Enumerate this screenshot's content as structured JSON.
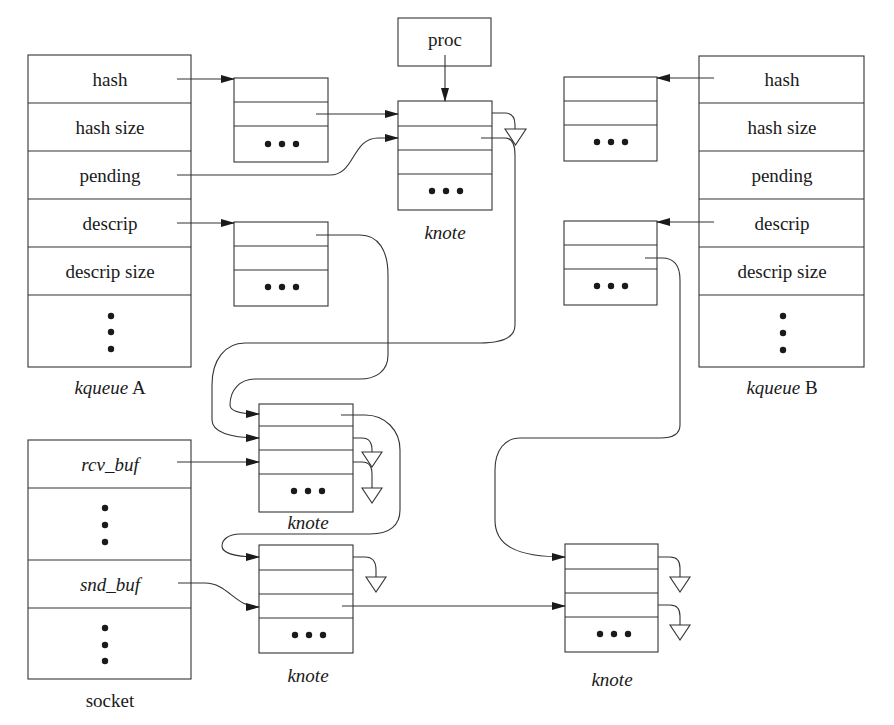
{
  "diagram": {
    "kqueue_a": {
      "caption_italic": "kqueue",
      "caption_suffix": " A",
      "fields": [
        "hash",
        "hash size",
        "pending",
        "descrip",
        "descrip size"
      ],
      "ellipsis": "⋮"
    },
    "kqueue_b": {
      "caption_italic": "kqueue",
      "caption_suffix": " B",
      "fields": [
        "hash",
        "hash size",
        "pending",
        "descrip",
        "descrip size"
      ],
      "ellipsis": "⋮"
    },
    "proc": {
      "label": "proc"
    },
    "socket": {
      "caption": "socket",
      "fields": [
        "rcv_buf",
        "snd_buf"
      ]
    },
    "knote_labels": {
      "top": "knote",
      "middle": "knote",
      "bottom_left": "knote",
      "bottom_right": "knote"
    },
    "colors": {
      "line": "#333333",
      "text": "#1a1a1a",
      "background": "#ffffff"
    }
  }
}
